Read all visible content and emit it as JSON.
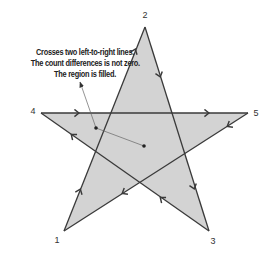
{
  "diagram": {
    "type": "nonzero-winding-fill-star",
    "colors": {
      "fill": "#d3d3d3",
      "stroke": "#3a3a3a",
      "pointer": "#555555",
      "text": "#222222"
    },
    "vertices": [
      {
        "id": "1",
        "label": "1",
        "x": 64,
        "y": 231,
        "label_x": 57,
        "label_y": 243
      },
      {
        "id": "2",
        "label": "2",
        "x": 145,
        "y": 27,
        "label_x": 145,
        "label_y": 18
      },
      {
        "id": "3",
        "label": "3",
        "x": 209,
        "y": 231,
        "label_x": 213,
        "label_y": 244
      },
      {
        "id": "4",
        "label": "4",
        "x": 41,
        "y": 113,
        "label_x": 33,
        "label_y": 114
      },
      {
        "id": "5",
        "label": "5",
        "x": 248,
        "y": 113,
        "label_x": 256,
        "label_y": 116
      }
    ],
    "path_order": [
      "1",
      "2",
      "3",
      "4",
      "5",
      "1"
    ],
    "annotation": {
      "lines": [
        "Crosses two left-to-right lines.",
        "The count differences is not zero.",
        "The region is filled."
      ]
    },
    "pointer": {
      "arrow_tip": {
        "x": 80,
        "y": 82
      },
      "test_point": {
        "x": 96,
        "y": 128
      },
      "ray_end": {
        "x": 144,
        "y": 146
      }
    }
  }
}
